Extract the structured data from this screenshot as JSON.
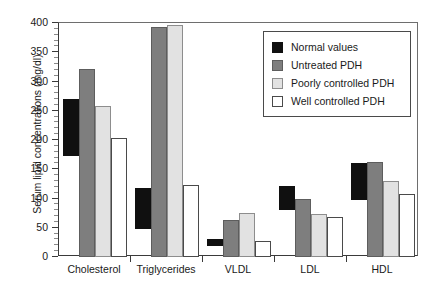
{
  "chart_data": {
    "type": "bar",
    "title": "",
    "xlabel": "",
    "ylabel": "Serum lipid concentrations (mg/dl)",
    "ylim": [
      0,
      400
    ],
    "ytick_step": 50,
    "yticks": [
      0,
      50,
      100,
      150,
      200,
      250,
      300,
      350,
      400
    ],
    "ytick_labels": [
      "0",
      "50",
      "100",
      "150",
      "200",
      "250",
      "300",
      "350",
      "400"
    ],
    "grid": false,
    "legend_position": "top-right",
    "categories": [
      "Cholesterol",
      "Triglycerides",
      "VLDL",
      "LDL",
      "HDL"
    ],
    "series": [
      {
        "name": "Normal values",
        "color": "#101010",
        "style": "range",
        "ranges": [
          [
            172,
            270
          ],
          [
            48,
            118
          ],
          [
            18,
            30
          ],
          [
            80,
            122
          ],
          [
            97,
            160
          ]
        ]
      },
      {
        "name": "Untreated PDH",
        "color": "#7e7e7e",
        "style": "bar",
        "values": [
          321,
          393,
          63,
          100,
          163
        ]
      },
      {
        "name": "Poorly controlled PDH",
        "color": "#e2e2e2",
        "style": "bar",
        "values": [
          258,
          396,
          75,
          73,
          130
        ]
      },
      {
        "name": "Well controlled PDH",
        "color": "#ffffff",
        "style": "bar",
        "values": [
          203,
          123,
          27,
          68,
          108
        ]
      }
    ]
  },
  "legend": {
    "items": [
      {
        "label": "Normal values"
      },
      {
        "label": "Untreated PDH"
      },
      {
        "label": "Poorly controlled PDH"
      },
      {
        "label": "Well controlled PDH"
      }
    ]
  }
}
